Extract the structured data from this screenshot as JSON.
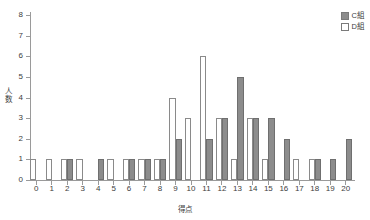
{
  "chart_data": {
    "type": "bar",
    "title": "",
    "xlabel": "得点",
    "ylabel": "人数",
    "categories": [
      "0",
      "1",
      "2",
      "3",
      "4",
      "5",
      "6",
      "7",
      "8",
      "9",
      "10",
      "11",
      "12",
      "13",
      "14",
      "15",
      "16",
      "17",
      "18",
      "19",
      "20"
    ],
    "series": [
      {
        "name": "C組",
        "color": "#8c8c8c",
        "values": [
          0,
          0,
          1,
          0,
          1,
          0,
          1,
          1,
          1,
          2,
          0,
          2,
          3,
          5,
          3,
          3,
          2,
          0,
          1,
          1,
          2
        ]
      },
      {
        "name": "D組",
        "color": "#ffffff",
        "values": [
          1,
          1,
          1,
          1,
          0,
          1,
          1,
          1,
          1,
          4,
          3,
          6,
          3,
          1,
          3,
          1,
          0,
          1,
          1,
          0,
          0
        ]
      }
    ],
    "ylim": [
      0,
      8
    ],
    "yticks": [
      "0",
      "1",
      "2",
      "3",
      "4",
      "5",
      "6",
      "7",
      "8"
    ],
    "xlim": [
      0,
      20
    ],
    "grid": false,
    "legend_position": "top-right",
    "axis_color": "#9a9a9a"
  },
  "legend": {
    "items": [
      {
        "label": "C組",
        "swatch": "series-c"
      },
      {
        "label": "D組",
        "swatch": "series-d"
      }
    ]
  },
  "axes": {
    "y_title_chars": [
      "人",
      "数"
    ],
    "x_title": "得点"
  }
}
